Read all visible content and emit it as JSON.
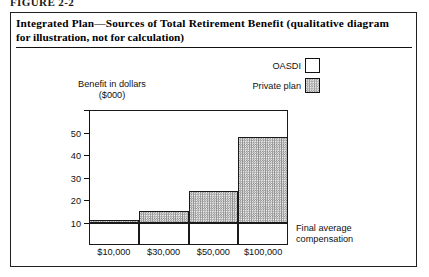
{
  "figure": {
    "caption_partial": "FIGURE 2-2",
    "title_line1": "Integrated Plan—Sources of Total Retirement Benefit (qualitative diagram",
    "title_line2": "for illustration, not for calculation)"
  },
  "legend": {
    "items": [
      {
        "label": "OASDI",
        "swatch": "white-square",
        "color": "#ffffff"
      },
      {
        "label": "Private plan",
        "swatch": "stippled-square",
        "color": "#d4d4d4"
      }
    ]
  },
  "axes": {
    "y_title_line1": "Benefit in dollars",
    "y_title_line2": "($000)",
    "x_title_line1": "Final average",
    "x_title_line2": "compensation"
  },
  "chart_data": {
    "type": "bar",
    "title": "Integrated Plan—Sources of Total Retirement Benefit (qualitative diagram for illustration, not for calculation)",
    "stacked": true,
    "categories": [
      "$10,000",
      "$30,000",
      "$50,000",
      "$100,000"
    ],
    "series": [
      {
        "name": "OASDI",
        "values": [
          10,
          10,
          10,
          10
        ]
      },
      {
        "name": "Private plan",
        "values": [
          1,
          5,
          14,
          38
        ]
      }
    ],
    "totals": [
      11,
      15,
      24,
      48
    ],
    "xlabel": "Final average compensation",
    "ylabel": "Benefit in dollars ($000)",
    "ylim": [
      0,
      60
    ],
    "yticks": [
      10,
      20,
      30,
      40,
      50
    ],
    "ytick_labels": [
      "10",
      "20",
      "30",
      "40",
      "50"
    ],
    "unlabeled_ytick": 60,
    "grid": false,
    "legend_position": "top-right"
  }
}
